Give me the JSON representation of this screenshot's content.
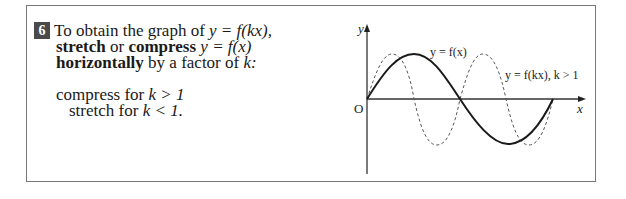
{
  "rule": {
    "number": "6",
    "line1_prefix": "To obtain the graph of ",
    "line1_math": "y = f(kx),",
    "line2_stretch": "stretch",
    "line2_or": " or ",
    "line2_compress": "compress",
    "line2_math": " y = f(x)",
    "line3_bold": "horizontally",
    "line3_rest": " by a factor of ",
    "line3_k": "k:",
    "case1": "compress for ",
    "case1_math": "k > 1",
    "case2": "stretch for ",
    "case2_math": "k < 1."
  },
  "graph": {
    "y_axis_label": "y",
    "x_axis_label": "x",
    "origin_label": "O",
    "solid_label": "y = f(x)",
    "dashed_label": "y = f(kx), k > 1"
  }
}
